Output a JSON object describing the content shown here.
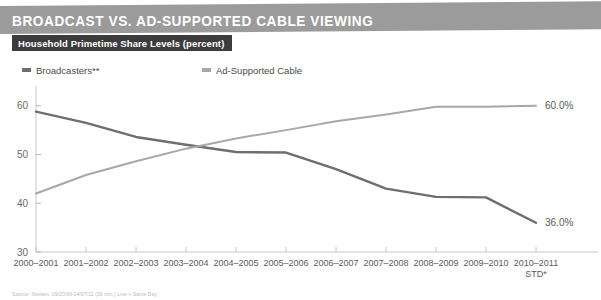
{
  "header": {
    "title": "BROADCAST VS. AD-SUPPORTED CABLE VIEWING",
    "banner_color": "#9b9b9b"
  },
  "subtitle": {
    "text": "Household Primetime Share Levels (percent)",
    "background_color": "#3c3c3c"
  },
  "legend": {
    "items": [
      {
        "label": "Broadcasters**",
        "color": "#6e6e6e"
      },
      {
        "label": "Ad-Supported Cable",
        "color": "#a8a8a8"
      }
    ]
  },
  "footnote": {
    "text": "Source: Nielsen, 09/20/99-04/07/11 (30 min.) Live + Same Day"
  },
  "chart_data": {
    "type": "line",
    "title": "BROADCAST VS. AD-SUPPORTED CABLE VIEWING",
    "subtitle": "Household Primetime Share Levels (percent)",
    "xlabel": "",
    "ylabel": "",
    "ylim": [
      30,
      62
    ],
    "yticks": [
      30,
      40,
      50,
      60
    ],
    "grid": false,
    "legend_position": "top-left",
    "categories": [
      "2000–2001",
      "2001–2002",
      "2002–2003",
      "2003–2004",
      "2004–2005",
      "2005–2006",
      "2006–2007",
      "2007–2008",
      "2008–2009",
      "2009–2010",
      "2010–2011 STD*"
    ],
    "last_category_line1": "2010–2011",
    "last_category_line2": "STD*",
    "series": [
      {
        "name": "Broadcasters**",
        "color": "#6e6e6e",
        "values": [
          58.8,
          56.5,
          53.6,
          52.0,
          50.5,
          50.4,
          47.0,
          43.0,
          41.3,
          41.2,
          36.0
        ],
        "end_label": "36.0%"
      },
      {
        "name": "Ad-Supported Cable",
        "color": "#a8a8a8",
        "values": [
          42.0,
          45.8,
          48.6,
          51.2,
          53.3,
          55.0,
          56.8,
          58.2,
          59.8,
          59.8,
          60.0
        ],
        "end_label": "60.0%"
      }
    ]
  }
}
